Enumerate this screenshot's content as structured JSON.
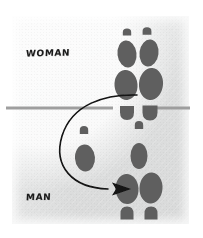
{
  "figure": {
    "type": "hand-drawn-diagram",
    "canvas": {
      "width": 203,
      "height": 238
    },
    "paper": {
      "background_color": "#e7e8e8",
      "margin_color": "#ffffff",
      "panel": {
        "x": 12,
        "y": 16,
        "width": 177,
        "height": 208
      }
    }
  },
  "labels": {
    "woman": "WOMAN",
    "man": "MAN"
  },
  "divider": {
    "name": "horizontal-line",
    "color": "#9a9a9a",
    "y": 108,
    "segments": [
      {
        "x1": 6,
        "x2": 113
      },
      {
        "x1": 152,
        "x2": 190
      }
    ],
    "thickness": 3
  },
  "arrow": {
    "name": "curved-motion-arrow",
    "color": "#121212",
    "stroke_width": 1.6,
    "path": "M 137 95 C 105 94, 72 104, 62 136 C 53 166, 72 188, 108 189",
    "head": {
      "x": 121,
      "y": 189,
      "direction": "right"
    }
  },
  "footprints": {
    "color": "#5e5e5e",
    "outline_color": "#4a4a4a",
    "groups": [
      {
        "name": "woman-upper-pair",
        "side": "above-line",
        "direction": "up",
        "shapes": [
          {
            "kind": "toe-cap",
            "cx": 127,
            "cy": 32,
            "rx": 4.2,
            "ry": 3.6
          },
          {
            "kind": "toe-cap",
            "cx": 147,
            "cy": 31,
            "rx": 4.4,
            "ry": 3.8
          },
          {
            "kind": "ball",
            "cx": 127,
            "cy": 54,
            "rx": 9.5,
            "ry": 13.5,
            "rot": -7
          },
          {
            "kind": "ball",
            "cx": 149,
            "cy": 53,
            "rx": 9.5,
            "ry": 13.5,
            "rot": 7
          },
          {
            "kind": "sole",
            "cx": 126,
            "cy": 85,
            "rx": 11.5,
            "ry": 15,
            "rot": -5
          },
          {
            "kind": "sole",
            "cx": 151,
            "cy": 84,
            "rx": 12,
            "ry": 16,
            "rot": 5
          },
          {
            "kind": "heel",
            "cx": 127,
            "cy": 113,
            "rx": 7,
            "ry": 7
          },
          {
            "kind": "heel",
            "cx": 150,
            "cy": 113,
            "rx": 7.5,
            "ry": 7.5
          }
        ]
      },
      {
        "name": "center-small-toe",
        "side": "below-line",
        "direction": "down",
        "shapes": [
          {
            "kind": "toe-cap",
            "cx": 139,
            "cy": 125,
            "rx": 4.2,
            "ry": 4
          }
        ]
      },
      {
        "name": "man-lower-pair",
        "side": "below-line",
        "direction": "down",
        "shapes": [
          {
            "kind": "ball",
            "cx": 139,
            "cy": 156,
            "rx": 8.5,
            "ry": 13,
            "rot": 0
          },
          {
            "kind": "sole",
            "cx": 127,
            "cy": 189,
            "rx": 11.5,
            "ry": 15,
            "rot": -4
          },
          {
            "kind": "sole",
            "cx": 151,
            "cy": 188,
            "rx": 11.5,
            "ry": 15.5,
            "rot": 4
          },
          {
            "kind": "heel",
            "cx": 127,
            "cy": 213,
            "rx": 6.5,
            "ry": 6.5
          },
          {
            "kind": "heel",
            "cx": 151,
            "cy": 213,
            "rx": 6.5,
            "ry": 6.5
          }
        ]
      },
      {
        "name": "left-single-print",
        "side": "below-line",
        "direction": "down",
        "shapes": [
          {
            "kind": "toe-cap",
            "cx": 84,
            "cy": 130,
            "rx": 4.2,
            "ry": 4
          },
          {
            "kind": "ball",
            "cx": 85,
            "cy": 158,
            "rx": 10,
            "ry": 13.5,
            "rot": -4
          }
        ]
      }
    ]
  }
}
